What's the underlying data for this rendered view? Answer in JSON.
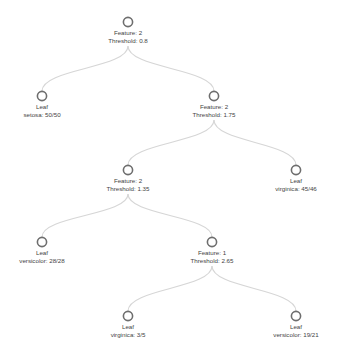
{
  "diagram": {
    "type": "decision-tree",
    "colors": {
      "link": "#d6d6d6",
      "node_stroke": "#6e6e6e",
      "text": "#444444"
    },
    "nodes": [
      {
        "id": "n0",
        "kind": "split",
        "line1": "Feature: 2",
        "line2": "Threshold: 0.8",
        "x": 128,
        "y": 22
      },
      {
        "id": "n1",
        "kind": "leaf",
        "line1": "Leaf",
        "line2": "setosa: 50/50",
        "x": 42,
        "y": 96,
        "parent": "n0"
      },
      {
        "id": "n2",
        "kind": "split",
        "line1": "Feature: 2",
        "line2": "Threshold: 1.75",
        "x": 214,
        "y": 96,
        "parent": "n0"
      },
      {
        "id": "n3",
        "kind": "split",
        "line1": "Feature: 2",
        "line2": "Threshold: 1.35",
        "x": 128,
        "y": 170,
        "parent": "n2"
      },
      {
        "id": "n4",
        "kind": "leaf",
        "line1": "Leaf",
        "line2": "virginica: 45/46",
        "x": 296,
        "y": 170,
        "parent": "n2"
      },
      {
        "id": "n5",
        "kind": "leaf",
        "line1": "Leaf",
        "line2": "versicolor: 28/28",
        "x": 42,
        "y": 242,
        "parent": "n3"
      },
      {
        "id": "n6",
        "kind": "split",
        "line1": "Feature: 1",
        "line2": "Threshold: 2.65",
        "x": 212,
        "y": 242,
        "parent": "n3"
      },
      {
        "id": "n7",
        "kind": "leaf",
        "line1": "Leaf",
        "line2": "virginica: 3/5",
        "x": 128,
        "y": 316,
        "parent": "n6"
      },
      {
        "id": "n8",
        "kind": "leaf",
        "line1": "Leaf",
        "line2": "versicolor: 19/21",
        "x": 296,
        "y": 316,
        "parent": "n6"
      }
    ]
  }
}
